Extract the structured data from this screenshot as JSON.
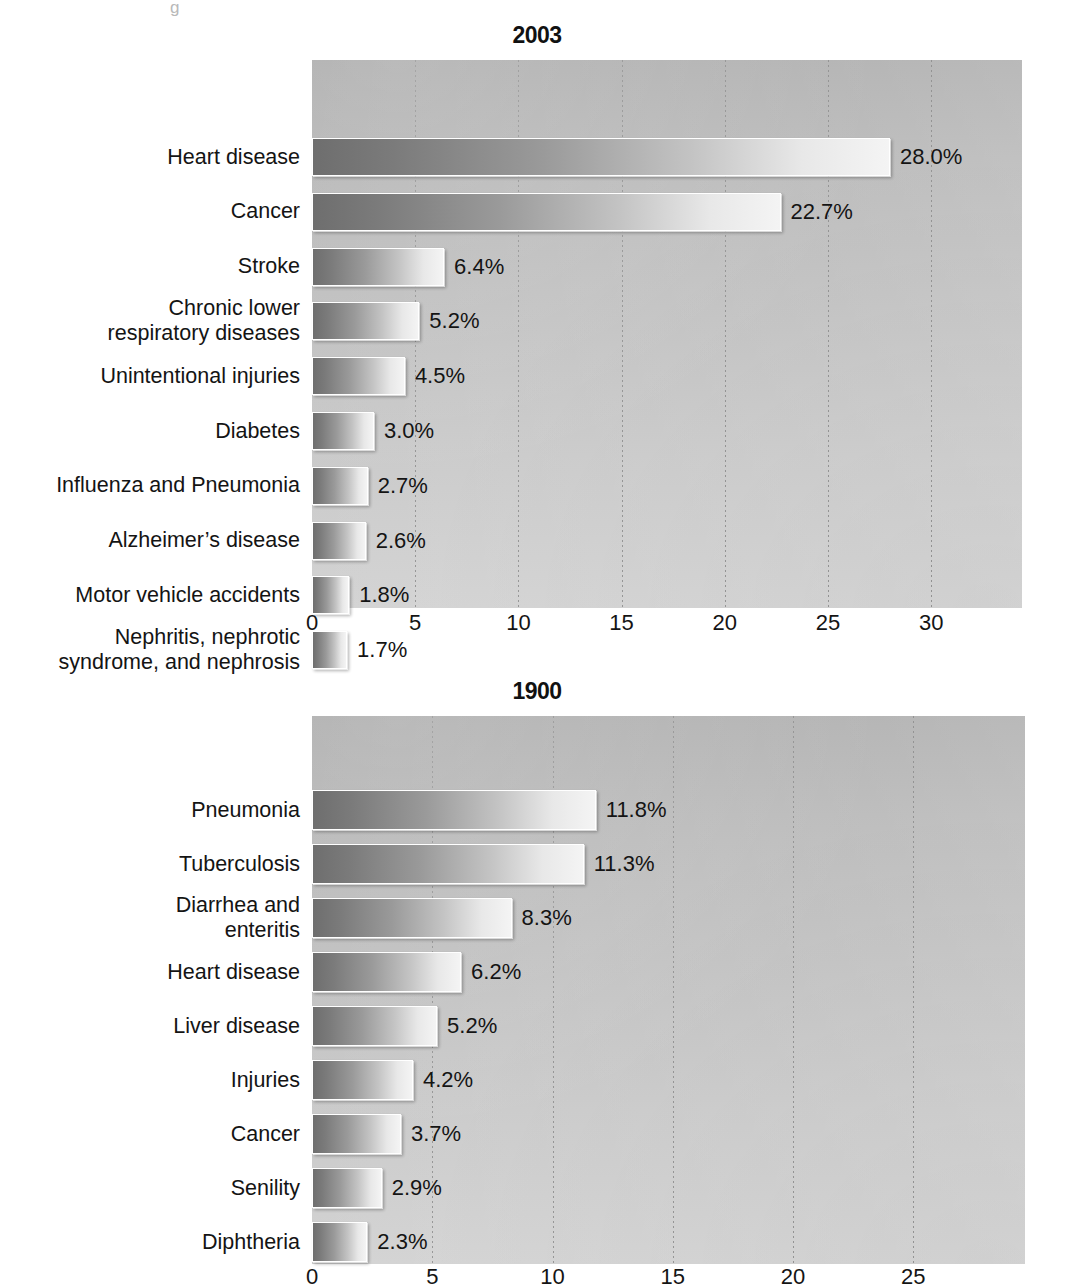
{
  "page": {
    "artifact_text": "g"
  },
  "charts": [
    {
      "id": "chart-2003",
      "title": "2003",
      "xticks": [
        "0",
        "5",
        "10",
        "15",
        "20",
        "25",
        "30"
      ],
      "categories": [
        "Heart disease",
        "Cancer",
        "Stroke",
        "Chronic lower\nrespiratory diseases",
        "Unintentional injuries",
        "Diabetes",
        "Influenza and Pneumonia",
        "Alzheimer’s disease",
        "Motor vehicle accidents",
        "Nephritis, nephrotic\nsyndrome, and nephrosis"
      ],
      "values": [
        28.0,
        22.7,
        6.4,
        5.2,
        4.5,
        3.0,
        2.7,
        2.6,
        1.8,
        1.7
      ],
      "labels": [
        "28.0%",
        "22.7%",
        "6.4%",
        "5.2%",
        "4.5%",
        "3.0%",
        "2.7%",
        "2.6%",
        "1.8%",
        "1.7%"
      ]
    },
    {
      "id": "chart-1900",
      "title": "1900",
      "xticks": [
        "0",
        "5",
        "10",
        "15",
        "20",
        "25"
      ],
      "categories": [
        "Pneumonia",
        "Tuberculosis",
        "Diarrhea and\nenteritis",
        "Heart disease",
        "Liver disease",
        "Injuries",
        "Cancer",
        "Senility",
        "Diphtheria"
      ],
      "values": [
        11.8,
        11.3,
        8.3,
        6.2,
        5.2,
        4.2,
        3.7,
        2.9,
        2.3
      ],
      "labels": [
        "11.8%",
        "11.3%",
        "8.3%",
        "6.2%",
        "5.2%",
        "4.2%",
        "3.7%",
        "2.9%",
        "2.3%"
      ]
    }
  ],
  "chart_data": [
    {
      "type": "bar",
      "orientation": "horizontal",
      "title": "2003",
      "xlabel": "",
      "ylabel": "",
      "xlim": [
        0,
        33.5
      ],
      "xticks": [
        0,
        5,
        10,
        15,
        20,
        25,
        30
      ],
      "grid": "vertical-dotted",
      "legend": "none",
      "categories": [
        "Heart disease",
        "Cancer",
        "Stroke",
        "Chronic lower respiratory diseases",
        "Unintentional injuries",
        "Diabetes",
        "Influenza and Pneumonia",
        "Alzheimer's disease",
        "Motor vehicle accidents",
        "Nephritis, nephrotic syndrome, and nephrosis"
      ],
      "values": [
        28.0,
        22.7,
        6.4,
        5.2,
        4.5,
        3.0,
        2.7,
        2.6,
        1.8,
        1.7
      ],
      "data_labels": [
        "28.0%",
        "22.7%",
        "6.4%",
        "5.2%",
        "4.5%",
        "3.0%",
        "2.7%",
        "2.6%",
        "1.8%",
        "1.7%"
      ]
    },
    {
      "type": "bar",
      "orientation": "horizontal",
      "title": "1900",
      "xlabel": "",
      "ylabel": "",
      "xlim": [
        0,
        29.5
      ],
      "xticks": [
        0,
        5,
        10,
        15,
        20,
        25
      ],
      "grid": "vertical-dotted",
      "legend": "none",
      "categories": [
        "Pneumonia",
        "Tuberculosis",
        "Diarrhea and enteritis",
        "Heart disease",
        "Liver disease",
        "Injuries",
        "Cancer",
        "Senility",
        "Diphtheria"
      ],
      "values": [
        11.8,
        11.3,
        8.3,
        6.2,
        5.2,
        4.2,
        3.7,
        2.9,
        2.3
      ],
      "data_labels": [
        "11.8%",
        "11.3%",
        "8.3%",
        "6.2%",
        "5.2%",
        "4.2%",
        "3.7%",
        "2.9%",
        "2.3%"
      ]
    }
  ]
}
